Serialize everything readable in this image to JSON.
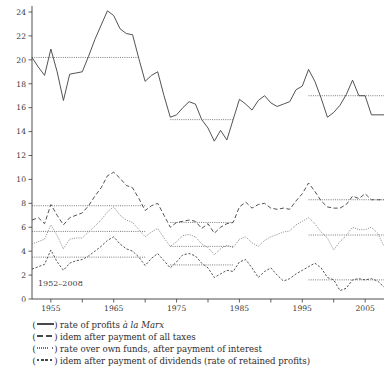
{
  "chart_data": {
    "type": "line",
    "title": "",
    "subtitle": "",
    "xlabel": "",
    "ylabel": "",
    "period_note": "1952–2008",
    "xlim": [
      1952,
      2008
    ],
    "ylim": [
      0,
      24
    ],
    "yticks": [
      0,
      2,
      4,
      6,
      8,
      10,
      12,
      14,
      16,
      18,
      20,
      22,
      24
    ],
    "ytick_labels": [
      "0",
      "2",
      "4",
      "6",
      "8",
      "10",
      "12",
      "14",
      "16",
      "18",
      "20",
      "22",
      "24"
    ],
    "xticks": [
      1955,
      1960,
      1965,
      1970,
      1975,
      1980,
      1985,
      1990,
      1995,
      2000,
      2005
    ],
    "xtick_labels": [
      "1955",
      "",
      "1965",
      "",
      "1975",
      "",
      "1985",
      "",
      "1995",
      "",
      "2005"
    ],
    "xtick_labels_shown": [
      "1955",
      "1965",
      "1975",
      "1985",
      "1995",
      "2005"
    ],
    "grid": false,
    "legend_position": "below",
    "x": [
      1952,
      1953,
      1954,
      1955,
      1956,
      1957,
      1958,
      1959,
      1960,
      1961,
      1962,
      1963,
      1964,
      1965,
      1966,
      1967,
      1968,
      1969,
      1970,
      1971,
      1972,
      1973,
      1974,
      1975,
      1976,
      1977,
      1978,
      1979,
      1980,
      1981,
      1982,
      1983,
      1984,
      1985,
      1986,
      1987,
      1988,
      1989,
      1990,
      1991,
      1992,
      1993,
      1994,
      1995,
      1996,
      1997,
      1998,
      1999,
      2000,
      2001,
      2002,
      2003,
      2004,
      2005,
      2006,
      2007,
      2008
    ],
    "series": [
      {
        "name": "rate of profits à la Marx",
        "style": "solid",
        "color": "#4a4a4a",
        "values": [
          20.2,
          19.4,
          18.7,
          20.9,
          19.0,
          16.6,
          18.8,
          18.9,
          19.0,
          20.3,
          21.7,
          22.9,
          24.1,
          23.7,
          22.6,
          22.2,
          22.1,
          20.1,
          18.2,
          18.7,
          19.0,
          17.0,
          15.2,
          15.4,
          16.0,
          16.5,
          16.3,
          15.0,
          14.3,
          13.2,
          14.1,
          13.3,
          15.0,
          16.7,
          16.3,
          15.8,
          16.6,
          17.0,
          16.4,
          16.1,
          16.3,
          16.5,
          17.5,
          17.8,
          19.2,
          18.2,
          16.8,
          15.2,
          15.6,
          16.2,
          17.1,
          18.3,
          17.0,
          17.0,
          15.4,
          15.4,
          15.4
        ]
      },
      {
        "name": "idem after payment of all taxes",
        "style": "dashed",
        "color": "#4a4a4a",
        "values": [
          6.6,
          6.8,
          6.3,
          7.9,
          7.0,
          6.2,
          6.8,
          7.0,
          7.2,
          7.8,
          8.6,
          9.3,
          10.3,
          10.6,
          10.1,
          9.5,
          9.3,
          8.4,
          7.4,
          7.8,
          8.0,
          7.0,
          6.0,
          6.4,
          6.5,
          6.6,
          6.5,
          5.9,
          6.3,
          5.5,
          6.0,
          6.3,
          6.4,
          7.7,
          8.1,
          7.6,
          7.9,
          8.0,
          7.6,
          7.5,
          7.6,
          7.5,
          8.2,
          8.8,
          9.7,
          9.0,
          8.2,
          7.7,
          7.6,
          7.6,
          7.9,
          8.6,
          8.4,
          8.8,
          8.3,
          8.3,
          8.3
        ]
      },
      {
        "name": "rate over own funds, after payment of interest",
        "style": "dotted",
        "color": "#7d7d7d",
        "values": [
          4.6,
          4.8,
          5.0,
          6.2,
          5.3,
          4.2,
          5.0,
          5.1,
          5.1,
          5.6,
          6.1,
          6.6,
          7.3,
          7.7,
          7.0,
          6.6,
          6.4,
          5.8,
          5.2,
          5.6,
          5.9,
          5.1,
          4.4,
          4.8,
          5.3,
          5.4,
          5.2,
          4.6,
          4.3,
          3.7,
          4.2,
          4.5,
          4.3,
          5.0,
          5.2,
          4.7,
          4.4,
          4.9,
          5.2,
          5.4,
          5.6,
          5.7,
          6.2,
          6.5,
          6.8,
          6.3,
          5.6,
          5.1,
          4.1,
          4.8,
          5.3,
          6.0,
          5.8,
          5.8,
          6.0,
          5.5,
          4.4
        ]
      },
      {
        "name": "idem after payment of dividends (rate of retained profits)",
        "style": "dashdot",
        "color": "#4a4a4a",
        "values": [
          2.5,
          2.7,
          2.9,
          4.1,
          3.1,
          2.4,
          3.0,
          3.2,
          3.3,
          3.6,
          4.0,
          4.4,
          4.9,
          5.2,
          4.6,
          4.2,
          4.0,
          3.5,
          2.8,
          3.4,
          3.8,
          3.2,
          2.6,
          3.1,
          3.7,
          3.8,
          3.6,
          3.0,
          2.6,
          1.8,
          2.1,
          2.4,
          2.3,
          3.1,
          3.3,
          2.6,
          1.8,
          2.3,
          2.6,
          2.0,
          1.5,
          1.7,
          2.1,
          2.4,
          2.7,
          3.0,
          2.6,
          1.8,
          1.6,
          0.7,
          0.9,
          1.6,
          1.7,
          1.6,
          1.7,
          1.5,
          1.0
        ]
      }
    ],
    "average_lines": [
      {
        "series": "rate of profits à la Marx",
        "value": 20.2,
        "x_start": 1952,
        "x_end": 1969
      },
      {
        "series": "rate of profits à la Marx",
        "value": 15.0,
        "x_start": 1974,
        "x_end": 1984
      },
      {
        "series": "rate of profits à la Marx",
        "value": 17.0,
        "x_start": 1996,
        "x_end": 2008
      },
      {
        "series": "idem after payment of all taxes",
        "value": 7.8,
        "x_start": 1952,
        "x_end": 1970
      },
      {
        "series": "idem after payment of all taxes",
        "value": 6.4,
        "x_start": 1974,
        "x_end": 1984
      },
      {
        "series": "idem after payment of all taxes",
        "value": 8.3,
        "x_start": 1996,
        "x_end": 2008
      },
      {
        "series": "rate over own funds, after payment of interest",
        "value": 5.65,
        "x_start": 1952,
        "x_end": 1970
      },
      {
        "series": "rate over own funds, after payment of interest",
        "value": 4.4,
        "x_start": 1974,
        "x_end": 1984
      },
      {
        "series": "rate over own funds, after payment of interest",
        "value": 5.35,
        "x_start": 1996,
        "x_end": 2008
      },
      {
        "series": "idem after payment of dividends (rate of retained profits)",
        "value": 3.5,
        "x_start": 1952,
        "x_end": 1970
      },
      {
        "series": "idem after payment of dividends (rate of retained profits)",
        "value": 2.85,
        "x_start": 1974,
        "x_end": 1984
      },
      {
        "series": "idem after payment of dividends (rate of retained profits)",
        "value": 1.6,
        "x_start": 1996,
        "x_end": 2008
      }
    ]
  },
  "legend": {
    "items": [
      {
        "key": "solid",
        "text_plain": "rate of profits à la Marx",
        "text_pre": "rate of profits ",
        "text_italic": "à la Marx",
        "text_post": ""
      },
      {
        "key": "dashed",
        "text_plain": "idem after payment of all taxes",
        "text_pre": "idem after payment of all taxes",
        "text_italic": "",
        "text_post": ""
      },
      {
        "key": "dotted",
        "text_plain": "rate over own funds, after payment of interest",
        "text_pre": "rate over own funds, after payment of interest",
        "text_italic": "",
        "text_post": ""
      },
      {
        "key": "dashdot",
        "text_plain": "idem after payment of dividends (rate of retained profits)",
        "text_pre": "idem after payment of dividends (rate of retained profits)",
        "text_italic": "",
        "text_post": ""
      }
    ],
    "paren_open": "(",
    "paren_close": ")"
  }
}
